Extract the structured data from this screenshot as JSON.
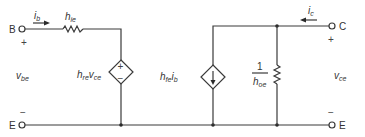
{
  "diagram": {
    "terminals": {
      "base": "B",
      "collector": "C",
      "emitter_left": "E",
      "emitter_right": "E"
    },
    "currents": {
      "input": {
        "main": "i",
        "sub": "b"
      },
      "output": {
        "main": "i",
        "sub": "c"
      }
    },
    "components": {
      "input_resistor": {
        "main": "h",
        "sub": "ie"
      },
      "voltage_source": {
        "main1": "h",
        "sub1": "re",
        "main2": "v",
        "sub2": "ce",
        "plus": "+",
        "minus": "−"
      },
      "current_source": {
        "main1": "h",
        "sub1": "fe",
        "main2": "i",
        "sub2": "b"
      },
      "output_conductance": {
        "numerator": "1",
        "main": "h",
        "sub": "oe"
      }
    },
    "voltages": {
      "input": {
        "main": "v",
        "sub": "be",
        "plus": "+",
        "minus": "−"
      },
      "output": {
        "main": "v",
        "sub": "ce",
        "plus": "+",
        "minus": "−"
      }
    },
    "colors": {
      "line": "#3a3a3a",
      "background": "#ffffff"
    }
  }
}
